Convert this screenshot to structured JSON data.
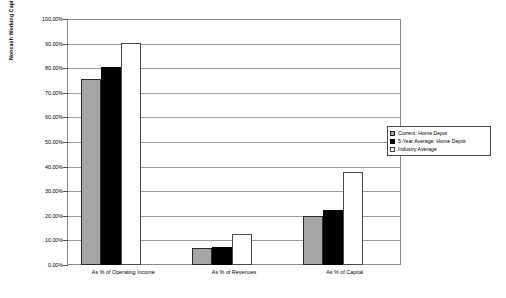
{
  "chart_data": {
    "type": "bar",
    "title": "",
    "xlabel": "",
    "ylabel": "Noncash Working Capital as % of Revenues",
    "ylim": [
      0,
      100
    ],
    "ytick_labels": [
      "100.00%",
      "90.00%",
      "80.00%",
      "70.00%",
      "60.00%",
      "50.00%",
      "40.00%",
      "30.00%",
      "20.00%",
      "10.00%",
      "0.00%"
    ],
    "ytick_values": [
      100,
      90,
      80,
      70,
      60,
      50,
      40,
      30,
      20,
      10,
      0
    ],
    "categories": [
      "As % of Operating Income",
      "As % of Revenues",
      "As % of Capital"
    ],
    "grid": true,
    "legend_position": "right",
    "series": [
      {
        "name": "Current: Home Depot",
        "color": "#a6a6a6",
        "values": [
          76.0,
          7.0,
          20.0
        ]
      },
      {
        "name": "5-Year Average: Home Depot",
        "color": "#000000",
        "values": [
          81.0,
          7.5,
          22.5
        ]
      },
      {
        "name": "Industry Average",
        "color": "#ffffff",
        "values": [
          90.5,
          12.5,
          38.0
        ]
      }
    ]
  },
  "legend": {
    "items": [
      {
        "label": "Current: Home Depot"
      },
      {
        "label": "5-Year Average: Home Depot"
      },
      {
        "label": "Industry Average"
      }
    ]
  }
}
